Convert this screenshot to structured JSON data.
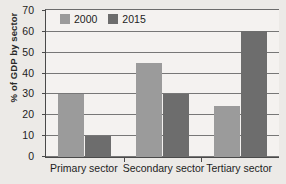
{
  "chart_data": {
    "type": "bar",
    "title": "",
    "xlabel": "",
    "ylabel": "% of GDP by sector",
    "categories": [
      "Primary sector",
      "Secondary sector",
      "Tertiary sector"
    ],
    "series": [
      {
        "name": "2000",
        "color": "#9b9b9b",
        "values": [
          30,
          45,
          24
        ]
      },
      {
        "name": "2015",
        "color": "#6d6d6d",
        "values": [
          10,
          30,
          60
        ]
      }
    ],
    "ylim": [
      0,
      70
    ],
    "ytick_step": 10,
    "yticks": [
      0,
      10,
      20,
      30,
      40,
      50,
      60,
      70
    ],
    "ytick_labels": [
      "0",
      "10",
      "20",
      "30",
      "40",
      "50",
      "60",
      "70"
    ],
    "grid": true,
    "grid_axis": "y",
    "legend_position": "top-left-inside",
    "background_color": "#eceae7",
    "plot_background_color": "#f4f2f0",
    "axis_color": "#4a4a4a",
    "grid_color": "#777777"
  }
}
